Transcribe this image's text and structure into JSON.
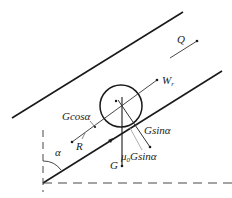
{
  "diagram": {
    "type": "force-diagram",
    "colors": {
      "line": "#1a1a1a",
      "thin_line": "#555555",
      "gray_line": "#999999",
      "background": "#ffffff"
    },
    "labels": {
      "Q": "Q",
      "W": "W",
      "W_sub": "r",
      "G_cos": "Gcosα",
      "R": "R",
      "G_sin": "Gsinα",
      "mu": "μ",
      "mu_sub": "0",
      "mu_rest": "Gsinα",
      "G": "G",
      "alpha": "α"
    }
  }
}
